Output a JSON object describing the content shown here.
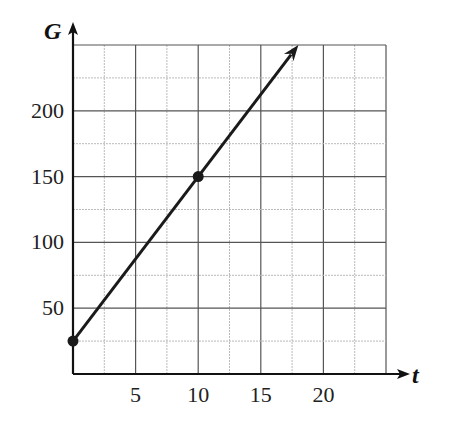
{
  "chart_data": {
    "type": "line",
    "title": "",
    "xlabel": "t",
    "ylabel": "G",
    "xlim": [
      0,
      25
    ],
    "ylim": [
      0,
      250
    ],
    "x_ticks": [
      5,
      10,
      15,
      20
    ],
    "y_ticks": [
      50,
      100,
      150,
      200
    ],
    "x_tick_labels": [
      "5",
      "10",
      "15",
      "20"
    ],
    "y_tick_labels": [
      "50",
      "100",
      "150",
      "200"
    ],
    "grid": true,
    "grid_minor_step_x": 2.5,
    "grid_minor_step_y": 25,
    "series": [
      {
        "name": "G(t)",
        "points": [
          [
            0,
            25
          ],
          [
            10,
            150
          ]
        ],
        "line_extends_to": [
          18,
          250
        ],
        "arrow_at_end": true,
        "marked_points": [
          [
            0,
            25
          ],
          [
            10,
            150
          ]
        ]
      }
    ],
    "slope": 12.5,
    "intercept": 25
  }
}
